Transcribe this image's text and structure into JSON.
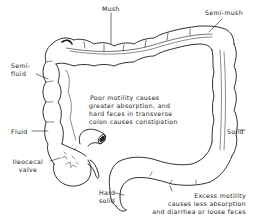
{
  "diagram": {
    "labels": {
      "mush": "Mush",
      "semi_mush": "Semi-mush",
      "semi_fluid_1": "Semi-",
      "semi_fluid_2": "fluid",
      "fluid": "Fluid",
      "ileocecal_1": "Ileocecal",
      "ileocecal_2": "valve",
      "hard_solid_1": "Hard",
      "hard_solid_2": "solid",
      "solid": "Solid"
    },
    "notes": {
      "poor_motility": [
        "Poor motility causes",
        "greater absorption, and",
        "hard feces in transverse",
        "colon causes constipation"
      ],
      "excess_motility": [
        "Excess motility",
        "causes less absorption",
        "and diarrhea or loose feces"
      ]
    },
    "colors": {
      "ink": "#1a1a1a",
      "paper": "#ffffff"
    }
  }
}
